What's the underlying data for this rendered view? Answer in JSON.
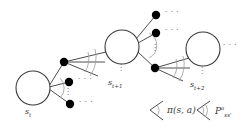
{
  "figure": {
    "type": "mdp-backup-diagram",
    "background_color": "#ffffff",
    "line_color": "#3a3a3a",
    "arc_color": "#9a9a9a",
    "node_fill": "#000000",
    "circle_stroke": "#3a3a3a",
    "text_color": "#333333"
  },
  "states": [
    {
      "id": "s_t",
      "label_base": "s",
      "label_sub": "t",
      "cx": 33,
      "cy": 88,
      "r": 17
    },
    {
      "id": "s_t1",
      "label_base": "s",
      "label_sub": "t+1",
      "cx": 122,
      "cy": 47,
      "r": 17
    },
    {
      "id": "s_t2",
      "label_base": "s",
      "label_sub": "t+2",
      "cx": 203,
      "cy": 49,
      "r": 17
    }
  ],
  "state_labels": [
    {
      "base": "s",
      "sub": "t",
      "x": 27,
      "y": 110
    },
    {
      "base": "s",
      "sub": "t+1",
      "x": 110,
      "y": 81
    },
    {
      "base": "s",
      "sub": "t+2",
      "x": 192,
      "y": 83
    }
  ],
  "action_nodes": [
    {
      "id": "a1",
      "cx": 64,
      "cy": 62,
      "r": 4.0
    },
    {
      "id": "a2",
      "cx": 69,
      "cy": 82,
      "r": 4.0
    },
    {
      "id": "a3",
      "cx": 70,
      "cy": 104,
      "r": 4.0
    },
    {
      "id": "b1",
      "cx": 156,
      "cy": 15,
      "r": 4.0
    },
    {
      "id": "b2",
      "cx": 156,
      "cy": 33,
      "r": 4.0
    },
    {
      "id": "b3",
      "cx": 155,
      "cy": 68,
      "r": 4.0
    }
  ],
  "horizontal_ellipses": [
    {
      "text": "· · ·",
      "x": 79,
      "y": 79
    },
    {
      "text": "· · ·",
      "x": 80,
      "y": 101
    },
    {
      "text": "· · ·",
      "x": 166,
      "y": 11
    },
    {
      "text": "· · ·",
      "x": 166,
      "y": 29
    },
    {
      "text": "· · ·",
      "x": 224,
      "y": 44
    }
  ],
  "vertical_ellipses": [
    {
      "text": "·\n·\n·",
      "x": 69,
      "y": 88
    },
    {
      "text": "·\n·\n·",
      "x": 122,
      "y": 66
    },
    {
      "text": "·\n·\n·",
      "x": 155,
      "y": 45
    },
    {
      "text": "·\n·\n·",
      "x": 203,
      "y": 69
    }
  ],
  "legend": {
    "items": [
      {
        "id": "policy",
        "symbol": "angle-bracket-single-arc",
        "label_main": "π(s, a)",
        "bracket_x": 150,
        "bracket_y": 110,
        "label_x": 168,
        "label_y": 114
      },
      {
        "id": "transition",
        "symbol": "angle-bracket-double-arc",
        "label_base": "P",
        "label_sup": "a",
        "label_sub": "ss'",
        "bracket_x": 197,
        "bracket_y": 110,
        "label_x": 216,
        "label_y": 114
      }
    ]
  }
}
